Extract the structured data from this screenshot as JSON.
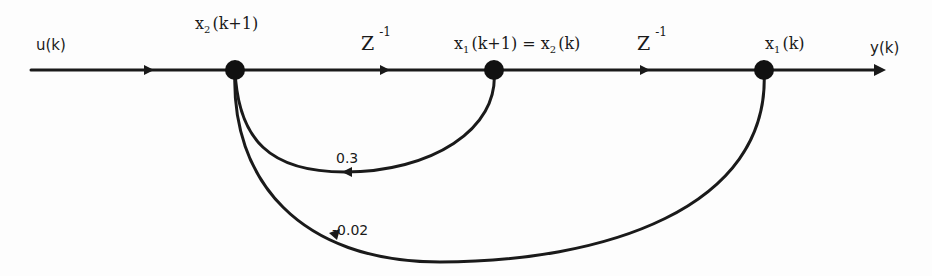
{
  "diagram": {
    "type": "signal-flow-graph",
    "colors": {
      "line": "#1a1a1a",
      "node": "#111111",
      "background": "#fdfdfd"
    },
    "input_label": "u(k)",
    "output_label": "y(k)",
    "nodes": [
      {
        "id": "n1",
        "label_base": "x",
        "label_sub": "2",
        "label_arg": "(k+1)",
        "x": 235,
        "y": 70
      },
      {
        "id": "n2",
        "label_base": "x",
        "label_sub": "1",
        "label_arg": "(k+1) = x",
        "label_sub2": "2",
        "label_arg2": "(k)",
        "x": 494,
        "y": 70
      },
      {
        "id": "n3",
        "label_base": "x",
        "label_sub": "1",
        "label_arg": "(k)",
        "x": 764,
        "y": 70
      }
    ],
    "forward_branches": [
      {
        "from": "input",
        "to": "n1",
        "gain": ""
      },
      {
        "from": "n1",
        "to": "n2",
        "gain_base": "Z",
        "gain_sup": "-1"
      },
      {
        "from": "n2",
        "to": "n3",
        "gain_base": "Z",
        "gain_sup": "-1"
      },
      {
        "from": "n3",
        "to": "output",
        "gain": ""
      }
    ],
    "feedback_branches": [
      {
        "from": "n2",
        "to": "n1",
        "gain": "0.3"
      },
      {
        "from": "n3",
        "to": "n1",
        "gain": "-0.02"
      }
    ]
  }
}
